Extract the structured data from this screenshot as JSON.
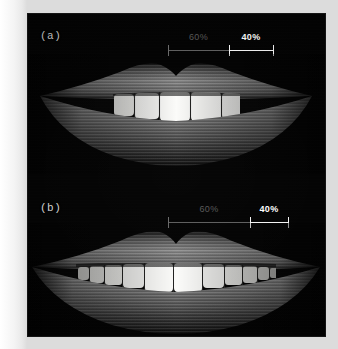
{
  "figure": {
    "background_color": "#020202",
    "paper_color": "#ffffff",
    "panel_count": 2
  },
  "panels": [
    {
      "id": "a",
      "tag": "(a)",
      "description": "narrow smile with wide buccal corridors",
      "visible_teeth": 6,
      "mouth_width_px": 222,
      "measurement": {
        "segments": [
          {
            "label": "60%",
            "value": 60,
            "style": "dim",
            "color": "#585858"
          },
          {
            "label": "40%",
            "value": 40,
            "style": "bright",
            "color": "#ffffff"
          }
        ],
        "tick_positions_px": [
          168,
          237,
          280
        ],
        "bar_left_px": 140,
        "bar_right_px": 252
      }
    },
    {
      "id": "b",
      "tag": "(b)",
      "description": "broad smile with minimal buccal corridors",
      "visible_teeth": 11,
      "mouth_width_px": 262,
      "measurement": {
        "segments": [
          {
            "label": "60%",
            "value": 60,
            "style": "dim",
            "color": "#585858"
          },
          {
            "label": "40%",
            "value": 40,
            "style": "bright",
            "color": "#ffffff"
          }
        ],
        "tick_positions_px": [
          168,
          258,
          295
        ],
        "bar_left_px": 140,
        "bar_right_px": 267
      }
    }
  ],
  "colors": {
    "teeth": "#f6f6f4",
    "lip_highlight": "#b8b8b8",
    "lip_mid": "#6a6a6a",
    "lip_shadow": "#1a1a1a",
    "oral_cavity": "#050505",
    "measure_dim": "#5e5e5e",
    "measure_bright": "#f2f2f2"
  }
}
